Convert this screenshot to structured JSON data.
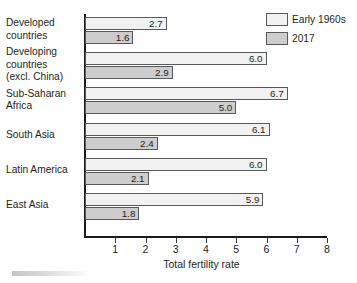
{
  "chart_data": {
    "type": "bar",
    "orientation": "horizontal",
    "title": "",
    "xlabel": "Total fertility rate",
    "ylabel": "",
    "xlim": [
      0,
      8.4
    ],
    "xticks": [
      1,
      2,
      3,
      4,
      5,
      6,
      7,
      8
    ],
    "xtick_labels": [
      "1",
      "2",
      "3",
      "4",
      "5",
      "6",
      "7",
      "8"
    ],
    "grid": false,
    "legend_position": "top-right",
    "categories": [
      "Developed countries",
      "Developing countries (excl. China)",
      "Sub-Saharan Africa",
      "South Asia",
      "Latin America",
      "East Asia"
    ],
    "category_label_lines": [
      [
        "Developed",
        "countries"
      ],
      [
        "Developing",
        "countries",
        "(excl. China)"
      ],
      [
        "Sub-Saharan",
        "Africa"
      ],
      [
        "South Asia"
      ],
      [
        "Latin America"
      ],
      [
        "East Asia"
      ]
    ],
    "series": [
      {
        "name": "Early 1960s",
        "color": "#f2f2f2",
        "values": [
          2.7,
          6.0,
          6.7,
          6.1,
          6.0,
          5.9
        ],
        "value_labels": [
          "2.7",
          "6.0",
          "6.7",
          "6.1",
          "6.0",
          "5.9"
        ]
      },
      {
        "name": "2017",
        "color": "#cdcdcd",
        "values": [
          1.6,
          2.9,
          5.0,
          2.4,
          2.1,
          1.8
        ],
        "value_labels": [
          "1.6",
          "2.9",
          "5.0",
          "2.4",
          "2.1",
          "1.8"
        ]
      }
    ]
  },
  "legend": {
    "items": [
      {
        "label": "Early 1960s",
        "swatch": "s0"
      },
      {
        "label": "2017",
        "swatch": "s1"
      }
    ]
  },
  "axis": {
    "x_title": "Total fertility rate"
  }
}
